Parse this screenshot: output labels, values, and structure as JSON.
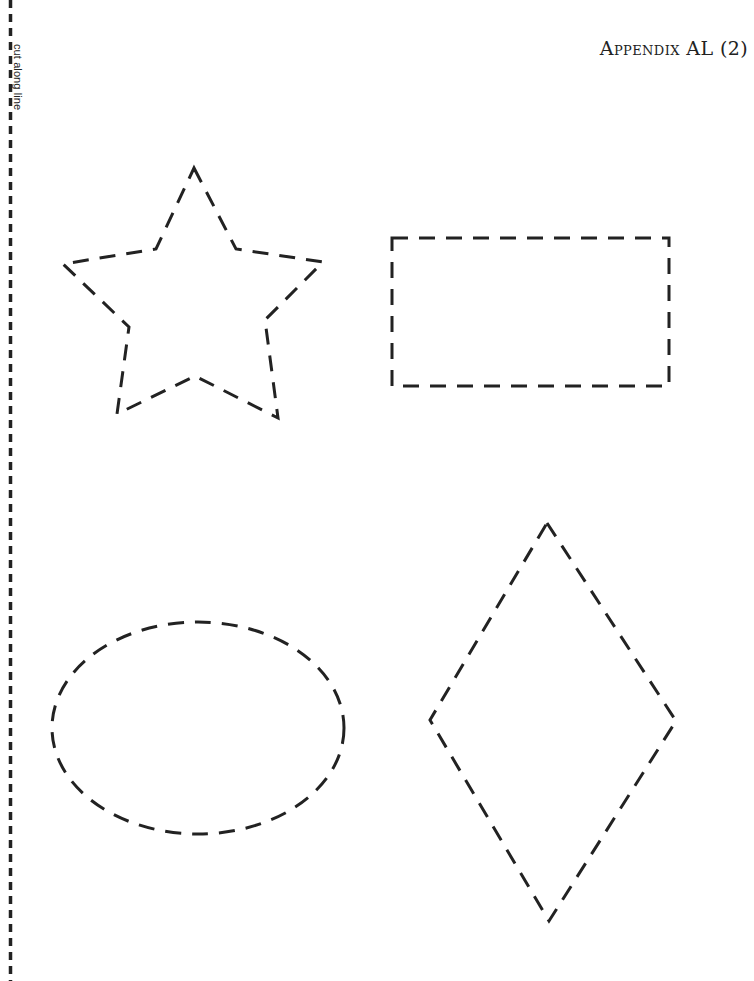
{
  "page": {
    "title": "Appendix AL (2)",
    "cut_line_label": "cut along line"
  },
  "colors": {
    "ink": "#222222",
    "background": "#ffffff"
  },
  "shapes": [
    {
      "name": "star",
      "style": "dashed outline",
      "position": "top-left"
    },
    {
      "name": "rectangle",
      "style": "dashed outline",
      "position": "top-right"
    },
    {
      "name": "oval",
      "style": "dashed outline",
      "position": "bottom-left"
    },
    {
      "name": "diamond",
      "style": "dashed outline",
      "position": "bottom-right"
    }
  ]
}
